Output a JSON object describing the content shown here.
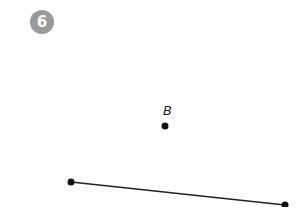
{
  "badge": {
    "number": "6",
    "color": "#9a9a9a"
  },
  "points": [
    {
      "label": "B",
      "x": 165,
      "y": 126
    }
  ],
  "segment": {
    "x1": 71,
    "y1": 182,
    "x2": 285,
    "y2": 205
  }
}
